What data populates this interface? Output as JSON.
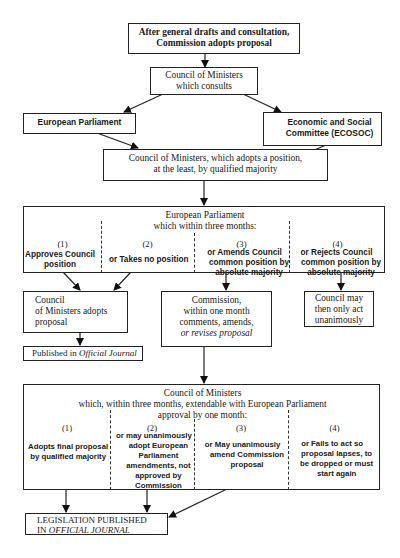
{
  "diagram": {
    "nodes": {
      "commission_adopts": {
        "line1": "After general drafts and consultation,",
        "line2": "Commission adopts proposal"
      },
      "council_consults": {
        "line1": "Council of Ministers",
        "line2": "which consults"
      },
      "european_parliament": {
        "label": "European Parliament"
      },
      "ecosoc": {
        "line1": "Economic and Social",
        "line2": "Committee (ECOSOC)"
      },
      "council_position": {
        "line1": "Council of Ministers, which adopts a position,",
        "line2": "at the least, by qualified majority"
      },
      "ep_review": {
        "title1": "European Parliament",
        "title2": "which within three months:",
        "options": [
          {
            "num": "(1)",
            "text1": "Approves Council",
            "text2": "position",
            "text3": ""
          },
          {
            "num": "(2)",
            "text1": "or Takes no position",
            "text2": "",
            "text3": ""
          },
          {
            "num": "(3)",
            "text1": "or Amends Council",
            "text2": "common position by",
            "text3": "absolute majority"
          },
          {
            "num": "(4)",
            "text1": "or Rejects Council",
            "text2": "common position by",
            "text3": "absolute majority"
          }
        ]
      },
      "council_adopts": {
        "line1": "Council",
        "line2": "of Ministers adopts",
        "line3": "proposal"
      },
      "commission_revises": {
        "line1": "Commission,",
        "line2": "within one month",
        "line3": "comments, amends,",
        "line4": "or revises proposal"
      },
      "council_unanimous": {
        "line1": "Council may",
        "line2": "then only act",
        "line3": "unanimously"
      },
      "published": {
        "prefix": "Published in ",
        "italic": "Official Journal"
      },
      "council_review": {
        "title1": "Council of Ministers",
        "title2": "which, within three months, extendable with European Parliament",
        "title3": "approval by one month:",
        "options": [
          {
            "num": "(1)",
            "lines": [
              "Adopts final proposal",
              "by qualified majority"
            ]
          },
          {
            "num": "(2)",
            "lines": [
              "or may unanimously",
              "adopt European",
              "Parliament",
              "amendments, not",
              "approved by",
              "Commission"
            ]
          },
          {
            "num": "(3)",
            "lines": [
              "or May unanimously",
              "amend Commission",
              "proposal"
            ]
          },
          {
            "num": "(4)",
            "lines": [
              "or Fails to act so",
              "proposal lapses, to",
              "be dropped or must",
              "start again"
            ]
          }
        ]
      },
      "legislation": {
        "line1": "LEGISLATION PUBLISHED",
        "line2_prefix": "IN ",
        "line2_italic": "OFFICIAL JOURNAL"
      }
    },
    "edges": [
      [
        "commission_adopts",
        "council_consults"
      ],
      [
        "council_consults",
        "european_parliament"
      ],
      [
        "council_consults",
        "ecosoc"
      ],
      [
        "european_parliament",
        "council_position"
      ],
      [
        "ecosoc",
        "council_position"
      ],
      [
        "council_position",
        "ep_review"
      ],
      [
        "ep_review.1",
        "council_adopts"
      ],
      [
        "ep_review.2",
        "council_adopts"
      ],
      [
        "ep_review.3",
        "commission_revises"
      ],
      [
        "ep_review.4",
        "council_unanimous"
      ],
      [
        "council_adopts",
        "published"
      ],
      [
        "commission_revises",
        "council_review"
      ],
      [
        "council_review.1",
        "legislation"
      ],
      [
        "council_review.2",
        "legislation"
      ],
      [
        "council_review.3",
        "legislation"
      ]
    ]
  }
}
